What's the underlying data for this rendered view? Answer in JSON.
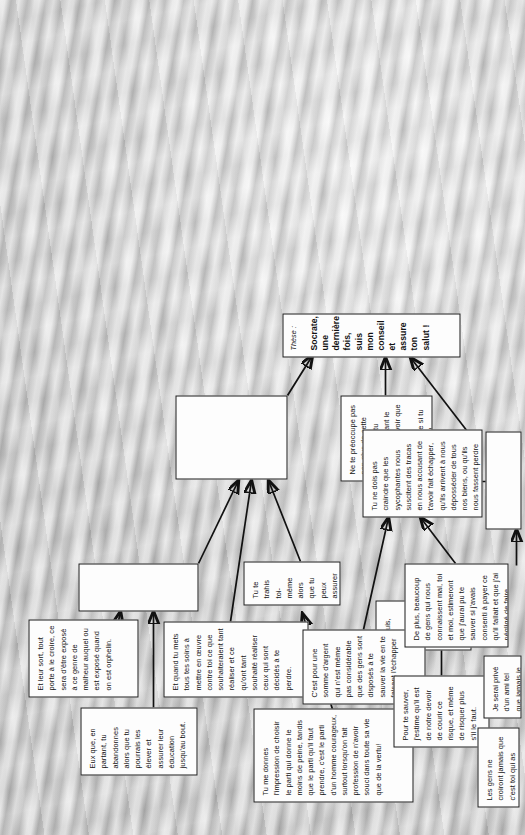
{
  "document": {
    "type": "argument-flowchart",
    "language": "fr",
    "orientation": "rotated-90-counterclockwise",
    "background": "#c9c9c9"
  },
  "nodes": [
    {
      "id": "n1",
      "name": "premise-impression-parti",
      "text": "Tu me donnes l'impression de choisir le parti qui donne le moins de peine, tandis que le parti qu'il faut prendre, c'est le parti d'un homme courageux, surtout lorsqu'on fait profession de n'avoir souci dans toute sa vie que de la vertu!"
    },
    {
      "id": "n2",
      "name": "premise-eux-en-partant",
      "text": "Eux que, en partant, tu abandonnes alors que tu pourrais les élever et assurer leur éducation jusqu'au bout."
    },
    {
      "id": "n3",
      "name": "premise-leur-sort-orphelin",
      "text": "Et leur sort, tout porte à le croire, ce sera d'être exposé à ce genre de malheur auquel ou est exposé quand on est orphelin."
    },
    {
      "id": "n4",
      "name": "premise-tu-mets-tous-tes-soins",
      "text": "Et quand tu mets tous tes soins à mettre en œuvre contre toi ce que souhaiteraient tant réaliser et ce qu'ont tant souhaité réaliser ceux qui sont décidés à te perdre."
    },
    {
      "id": "n5",
      "name": "premise-tu-te-trahis",
      "text": "Tu te trahis toi-même alors que tu peux assurer ton salut."
    },
    {
      "id": "n6",
      "name": "premise-sycophantes-bon-marche",
      "text": "Et puis, ces sycophantes, ne vois-tu pas qu'on les achète à bon marché."
    },
    {
      "id": "n7",
      "name": "premise-somme-argent",
      "text": "C'est pour une somme d'argent qui n'est même pas considérable que des gens sont disposés à te sauver la vie en te faisant l'échapper d'ici."
    },
    {
      "id": "n8",
      "name": "premise-pour-te-sauver",
      "text": "Pour te sauver, j'estime qu'il est de notre devoir de courir ce risque, et même de risquer plus s'il le faut."
    },
    {
      "id": "n9",
      "name": "premise-de-plus-beaucoup",
      "text": "De plus, beaucoup de gens qui nous connaissent mal, toi et moi, estimeront que j'aurai pu te sauver si j'avais consenti à payer ce qu'il fallait et que j'ai négligé de faire."
    },
    {
      "id": "n10",
      "name": "premise-les-gens-ne-croiront",
      "text": "Les gens ne croiront jamais que c'est toi qui as refusé de t'échapper d'ici, alors que nous le désirions ardemment."
    },
    {
      "id": "n11",
      "name": "premise-je-serai-prive",
      "text": "Je serai privé d'un ami tel que jamais je n'en trouverai de pareil."
    },
    {
      "id": "n12",
      "name": "premise-ne-preoccupe-pas",
      "text": "Ne te préoccupe pas non plus de cette difficulté que tu évoquais devant le tribunal, à savoir que tu ne saurais comment vivre si tu partais en exil."
    },
    {
      "id": "n13",
      "name": "premise-tu-ne-dois-pas-craindre",
      "text": "Tu ne dois pas craindre que les sycophantes nous suscitent des tracas en nous accusant de t'avoir fait échapper, qu'ils arrivent à nous déposséder de tous nos biens, ou qu'ils nous fassent perdre de l'argent et même parviennent à nous faire condamner à quelque autre peine."
    },
    {
      "id": "b1",
      "name": "intermediate-conclusion-box-top",
      "text": ""
    },
    {
      "id": "b2",
      "name": "intermediate-conclusion-box-middle",
      "text": ""
    },
    {
      "id": "b3",
      "name": "intermediate-conclusion-box-lower",
      "text": ""
    },
    {
      "id": "b4",
      "name": "intermediate-conclusion-box-bottom",
      "text": ""
    }
  ],
  "thesis": {
    "label": "Thèse :",
    "text": "Socrate, une dernière fois, suis mon conseil et assure ton salut !"
  }
}
